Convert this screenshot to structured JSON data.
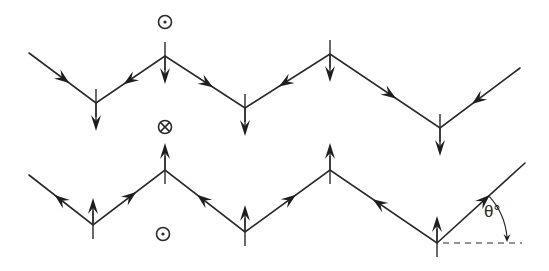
{
  "diagram": {
    "title": "",
    "colors": {
      "stroke": "#2a2a2a",
      "background": "#ffffff"
    },
    "top_wire": {
      "name": "top zigzag (moments pointing down)",
      "points": [
        [
          29,
          53
        ],
        [
          96,
          103
        ],
        [
          165,
          56
        ],
        [
          245,
          108
        ],
        [
          330,
          54
        ],
        [
          440,
          128
        ],
        [
          520,
          68
        ]
      ],
      "segment_arrows": [
        {
          "at": [
            75,
            88
          ],
          "dir": "down-right"
        },
        {
          "at": [
            124,
            84
          ],
          "dir": "down-left"
        },
        {
          "at": [
            213,
            87
          ],
          "dir": "down-right"
        },
        {
          "at": [
            286,
            84
          ],
          "dir": "down-left"
        },
        {
          "at": [
            398,
            100
          ],
          "dir": "down-right"
        },
        {
          "at": [
            472,
            104
          ],
          "dir": "down-left"
        }
      ],
      "vertex_arrows": [
        {
          "x": 96,
          "y": 103,
          "dir": "down"
        },
        {
          "x": 165,
          "y": 56,
          "dir": "down"
        },
        {
          "x": 245,
          "y": 108,
          "dir": "down"
        },
        {
          "x": 330,
          "y": 54,
          "dir": "down"
        },
        {
          "x": 440,
          "y": 128,
          "dir": "down"
        }
      ]
    },
    "bottom_wire": {
      "name": "bottom zigzag (moments pointing up)",
      "points": [
        [
          29,
          175
        ],
        [
          93,
          225
        ],
        [
          165,
          170
        ],
        [
          245,
          232
        ],
        [
          330,
          170
        ],
        [
          437,
          243
        ],
        [
          525,
          163
        ]
      ],
      "segment_arrows": [
        {
          "at": [
            60,
            199
          ],
          "dir": "up-left"
        },
        {
          "at": [
            126,
            200
          ],
          "dir": "up-right"
        },
        {
          "at": [
            210,
            208
          ],
          "dir": "up-left"
        },
        {
          "at": [
            290,
            205
          ],
          "dir": "up-right"
        },
        {
          "at": [
            392,
            212
          ],
          "dir": "up-left"
        },
        {
          "at": [
            485,
            201
          ],
          "dir": "up-right"
        }
      ],
      "vertex_arrows": [
        {
          "x": 93,
          "y": 225,
          "dir": "up"
        },
        {
          "x": 165,
          "y": 170,
          "dir": "up"
        },
        {
          "x": 245,
          "y": 232,
          "dir": "up"
        },
        {
          "x": 330,
          "y": 170,
          "dir": "up"
        },
        {
          "x": 437,
          "y": 243,
          "dir": "up"
        }
      ]
    },
    "symbols": [
      {
        "type": "dot-in-circle",
        "meaning": "out of page",
        "x": 165,
        "y": 22
      },
      {
        "type": "cross-in-circle",
        "meaning": "into page",
        "x": 165,
        "y": 127
      },
      {
        "type": "dot-in-circle",
        "meaning": "out of page",
        "x": 163,
        "y": 234
      }
    ],
    "angle": {
      "label": "θ°",
      "vertex": [
        437,
        243
      ],
      "dashed_end": [
        522,
        243
      ]
    }
  }
}
